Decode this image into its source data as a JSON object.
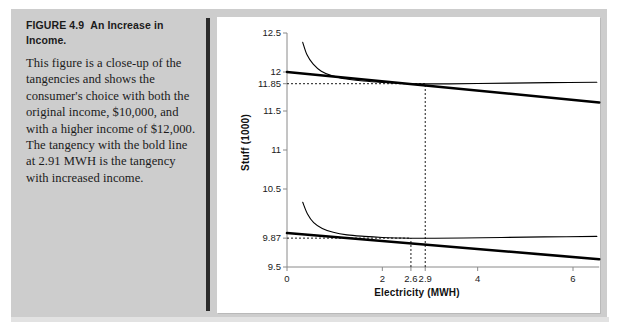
{
  "figure": {
    "title_label": "FIGURE 4.9",
    "title_rest": "An Increase in Income.",
    "body": "This figure is a close-up of the tangencies and shows the consumer's choice with both the original income, $10,000, and with a higher income of $12,000. The tangency with the bold line at 2.91 MWH is the tangency with increased income."
  },
  "chart_data": {
    "type": "line",
    "title": "",
    "xlabel": "Electricity (MWH)",
    "ylabel": "Stuff (1000)",
    "xlim": [
      0,
      6.6
    ],
    "ylim": [
      9.5,
      12.5
    ],
    "grid": false,
    "legend": "none",
    "xticks": [
      {
        "value": 0,
        "label": "0"
      },
      {
        "value": 2,
        "label": "2"
      },
      {
        "value": 2.6,
        "label": "2.6"
      },
      {
        "value": 2.9,
        "label": "2.9"
      },
      {
        "value": 4,
        "label": "4"
      },
      {
        "value": 6,
        "label": "6"
      }
    ],
    "yticks": [
      {
        "value": 12.5,
        "label": "12.5"
      },
      {
        "value": 12,
        "label": "12"
      },
      {
        "value": 11.85,
        "label": "11.85"
      },
      {
        "value": 11.5,
        "label": "11.5"
      },
      {
        "value": 11,
        "label": "11"
      },
      {
        "value": 10.5,
        "label": "10.5"
      },
      {
        "value": 9.87,
        "label": "9.87"
      },
      {
        "value": 9.5,
        "label": "9.5"
      }
    ],
    "annotations": [
      {
        "name": "upper-tangency",
        "x": 2.9,
        "y": 11.85,
        "note": "tangency with increased income $12,000"
      },
      {
        "name": "lower-tangency",
        "x": 2.6,
        "y": 9.87,
        "note": "tangency with original income $10,000"
      }
    ],
    "reference_lines": [
      {
        "name": "horizontal-11.85",
        "orientation": "horizontal",
        "value": 11.85,
        "style": "dashed",
        "x_from": 0,
        "x_to": 2.9
      },
      {
        "name": "horizontal-9.87",
        "orientation": "horizontal",
        "value": 9.87,
        "style": "dashed",
        "x_from": 0,
        "x_to": 2.6
      },
      {
        "name": "vertical-2.9",
        "orientation": "vertical",
        "value": 2.9,
        "style": "dashed",
        "y_from": 9.5,
        "y_to": 11.85
      },
      {
        "name": "vertical-2.6",
        "orientation": "vertical",
        "value": 2.6,
        "style": "dashed",
        "y_from": 9.5,
        "y_to": 9.87
      }
    ],
    "series": [
      {
        "name": "budget-line-high-income",
        "style": "bold-straight",
        "points": [
          [
            0,
            12.0
          ],
          [
            6.55,
            11.61
          ]
        ]
      },
      {
        "name": "indifference-curve-high-income",
        "style": "thin-curve",
        "points": [
          [
            0.33,
            12.38
          ],
          [
            0.42,
            12.22
          ],
          [
            0.55,
            12.1
          ],
          [
            0.72,
            12.01
          ],
          [
            0.95,
            11.95
          ],
          [
            1.25,
            11.91
          ],
          [
            1.6,
            11.884
          ],
          [
            2.0,
            11.866
          ],
          [
            2.45,
            11.853
          ],
          [
            2.9,
            11.848
          ],
          [
            3.4,
            11.848
          ],
          [
            4.0,
            11.852
          ],
          [
            4.7,
            11.858
          ],
          [
            5.5,
            11.864
          ],
          [
            6.5,
            11.868
          ]
        ]
      },
      {
        "name": "budget-line-original-income",
        "style": "bold-straight",
        "points": [
          [
            0,
            9.935
          ],
          [
            6.55,
            9.6
          ]
        ]
      },
      {
        "name": "indifference-curve-original-income",
        "style": "thin-curve",
        "points": [
          [
            0.33,
            10.33
          ],
          [
            0.43,
            10.18
          ],
          [
            0.56,
            10.07
          ],
          [
            0.74,
            9.995
          ],
          [
            0.97,
            9.945
          ],
          [
            1.26,
            9.912
          ],
          [
            1.62,
            9.893
          ],
          [
            2.0,
            9.879
          ],
          [
            2.35,
            9.872
          ],
          [
            2.6,
            9.869
          ],
          [
            3.1,
            9.868
          ],
          [
            3.7,
            9.872
          ],
          [
            4.5,
            9.879
          ],
          [
            5.4,
            9.886
          ],
          [
            6.5,
            9.892
          ]
        ]
      }
    ]
  }
}
